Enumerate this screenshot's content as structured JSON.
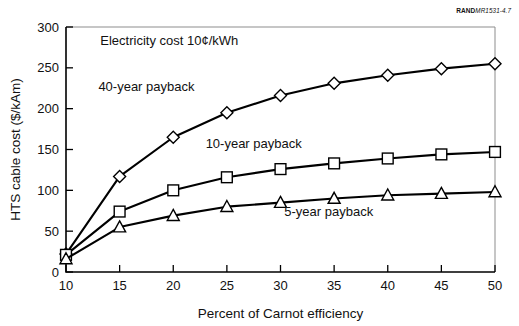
{
  "credit": {
    "prefix": "RAND",
    "id": "MR1531-4.7"
  },
  "chart_data": {
    "type": "line",
    "title": "",
    "xlabel": "Percent of Carnot efficiency",
    "ylabel": "HTS cable cost ($/kAm)",
    "xlim": [
      10,
      50
    ],
    "ylim": [
      0,
      300
    ],
    "xticks": [
      10,
      15,
      20,
      25,
      30,
      35,
      40,
      45,
      50
    ],
    "yticks": [
      0,
      50,
      100,
      150,
      200,
      250,
      300
    ],
    "grid": false,
    "legend_position": "inline-annotations",
    "annotations": [
      {
        "text": "Electricity cost 10¢/kWh",
        "x": 13.2,
        "y": 278
      }
    ],
    "x": [
      10,
      15,
      20,
      25,
      30,
      35,
      40,
      45,
      50
    ],
    "series": [
      {
        "name": "40-year payback",
        "marker": "diamond",
        "label_x": 17.5,
        "label_y": 222,
        "values": [
          22,
          117,
          165,
          195,
          216,
          231,
          241,
          249,
          255
        ]
      },
      {
        "name": "10-year payback",
        "marker": "square",
        "label_x": 27.5,
        "label_y": 152,
        "values": [
          21,
          74,
          100,
          116,
          126,
          133,
          139,
          144,
          147
        ]
      },
      {
        "name": "5-year payback",
        "marker": "triangle",
        "label_x": 34.5,
        "label_y": 68,
        "values": [
          16,
          55,
          69,
          80,
          85,
          90,
          94,
          96,
          98
        ]
      }
    ]
  }
}
